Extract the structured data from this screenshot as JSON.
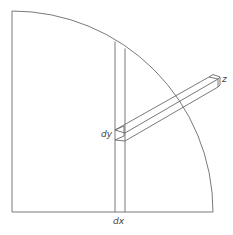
{
  "diagram": {
    "type": "quarter-disk integration element",
    "labels": {
      "dx": "dx",
      "dy": "dy",
      "z": "z"
    },
    "colors": {
      "stroke": "#6a6a6a",
      "text": "#444444",
      "background": "#ffffff"
    }
  }
}
